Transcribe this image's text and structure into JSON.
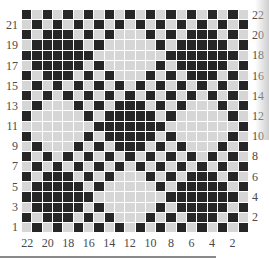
{
  "figure": {
    "type": "weaving-drawdown-grid",
    "rows": 22,
    "cols": 22,
    "dark_color": "#262626",
    "light_color": "#d6d6d6",
    "pattern_rule": {
      "checker": "cell dark where (row+col) even",
      "diamond_radius": 3,
      "diamond_centers_period": 7,
      "diamond_origin": {
        "row": 4,
        "col": 3
      },
      "dark_diamonds": [
        [
          4,
          3
        ],
        [
          4,
          17
        ],
        [
          11,
          10
        ],
        [
          18,
          3
        ],
        [
          18,
          17
        ]
      ],
      "light_diamonds": [
        [
          4,
          10
        ],
        [
          11,
          3
        ],
        [
          11,
          17
        ],
        [
          18,
          10
        ]
      ]
    },
    "left_labels": [
      "21",
      "19",
      "17",
      "15",
      "13",
      "11",
      "9",
      "7",
      "5",
      "3",
      "1"
    ],
    "right_labels": [
      "22",
      "20",
      "18",
      "16",
      "14",
      "12",
      "10",
      "8",
      "6",
      "4",
      "2"
    ],
    "bottom_labels": [
      "22",
      "20",
      "18",
      "16",
      "14",
      "12",
      "10",
      "8",
      "6",
      "4",
      "2"
    ]
  }
}
